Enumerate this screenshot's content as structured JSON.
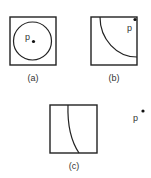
{
  "panels": [
    {
      "id": "a",
      "caption": "(a)",
      "point_label": "p",
      "description": "point p inside a circle within a square"
    },
    {
      "id": "b",
      "caption": "(b)",
      "point_label": "p",
      "description": "point p at the corner of a square, quarter arc"
    },
    {
      "id": "c",
      "caption": "(c)",
      "point_label": "p",
      "description": "point p outside a square with a curve"
    }
  ],
  "colors": {
    "stroke": "#222222",
    "text": "#333333"
  }
}
